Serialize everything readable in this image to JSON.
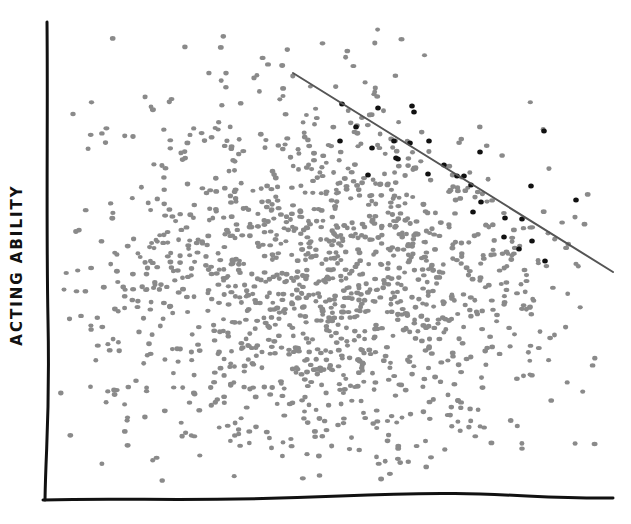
{
  "chart_data": {
    "type": "scatter",
    "title": "",
    "xlabel": "",
    "xlabel_note": "x-axis label is cut off at bottom edge of image (only tops of letters visible)",
    "ylabel": "ACTING ABILITY",
    "grid": false,
    "legend": null,
    "ticks": false,
    "style": "hand-drawn",
    "colors": {
      "background": "#ffffff",
      "axis": "#111111",
      "dot_default": "#8a8a8a",
      "dot_selected": "#111111",
      "cutoff_line": "#555555"
    },
    "axes_pixels": {
      "y_axis": {
        "x": 47,
        "y_top": 22,
        "y_bottom": 500
      },
      "x_axis": {
        "y": 500,
        "x_left": 43,
        "x_right": 613
      }
    },
    "cloud": {
      "distribution": "bivariate normal, uncorrelated",
      "center_px": [
        330,
        278
      ],
      "std_px": [
        120,
        95
      ],
      "approx_point_count": 1500
    },
    "cutoff_line": {
      "from_px": [
        293,
        73
      ],
      "to_px": [
        613,
        272
      ],
      "meaning": "points above/right of line highlighted black (selection threshold)"
    },
    "series": [
      {
        "name": "all people",
        "color": "#8a8a8a",
        "description": "round cloud, no correlation"
      },
      {
        "name": "selected (above cutoff)",
        "color": "#111111",
        "description": "sparse black dots in upper-right beyond line; show negative correlation"
      }
    ],
    "highlighted_points_px": [
      [
        342,
        104
      ],
      [
        378,
        108
      ],
      [
        412,
        106
      ],
      [
        414,
        112
      ],
      [
        340,
        141
      ],
      [
        356,
        127
      ],
      [
        372,
        148
      ],
      [
        394,
        141
      ],
      [
        368,
        175
      ],
      [
        396,
        158
      ],
      [
        429,
        141
      ],
      [
        428,
        174
      ],
      [
        444,
        165
      ],
      [
        457,
        176
      ],
      [
        471,
        185
      ],
      [
        480,
        152
      ],
      [
        473,
        212
      ],
      [
        481,
        202
      ],
      [
        504,
        237
      ],
      [
        519,
        249
      ],
      [
        532,
        241
      ],
      [
        544,
        131
      ],
      [
        531,
        186
      ],
      [
        576,
        200
      ],
      [
        545,
        261
      ],
      [
        522,
        219
      ],
      [
        505,
        218
      ],
      [
        398,
        159
      ],
      [
        464,
        176
      ],
      [
        410,
        143
      ]
    ]
  }
}
